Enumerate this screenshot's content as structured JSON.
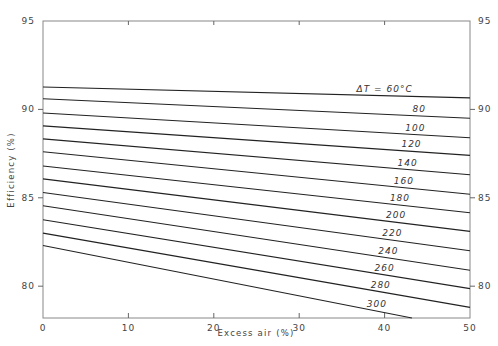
{
  "chart_data": {
    "type": "line",
    "title": "",
    "xlabel": "Excess air (%)",
    "ylabel": "Efficiency (%)",
    "xlim": [
      0,
      50
    ],
    "ylim": [
      78.2,
      95
    ],
    "grid": false,
    "x_ticks": [
      0,
      10,
      20,
      30,
      40,
      50
    ],
    "y_ticks": [
      80,
      85,
      90,
      95
    ],
    "y_ticks_right": [
      80,
      85,
      90,
      95
    ],
    "legend": "inline labels near right end of each line",
    "series": [
      {
        "name": "ΔT = 60°C",
        "label": "ΔT = 60°C",
        "x": [
          0,
          50
        ],
        "values": [
          91.27,
          90.65
        ]
      },
      {
        "name": "80",
        "label": "80",
        "x": [
          0,
          50
        ],
        "values": [
          90.6,
          89.5
        ]
      },
      {
        "name": "100",
        "label": "100",
        "x": [
          0,
          50
        ],
        "values": [
          89.8,
          88.4
        ]
      },
      {
        "name": "120",
        "label": "120",
        "x": [
          0,
          50
        ],
        "values": [
          89.07,
          87.4
        ]
      },
      {
        "name": "140",
        "label": "140",
        "x": [
          0,
          50
        ],
        "values": [
          88.33,
          86.3
        ]
      },
      {
        "name": "160",
        "label": "160",
        "x": [
          0,
          50
        ],
        "values": [
          87.6,
          85.2
        ]
      },
      {
        "name": "180",
        "label": "180",
        "x": [
          0,
          50
        ],
        "values": [
          86.8,
          84.15
        ]
      },
      {
        "name": "200",
        "label": "200",
        "x": [
          0,
          50
        ],
        "values": [
          86.07,
          83.1
        ]
      },
      {
        "name": "220",
        "label": "220",
        "x": [
          0,
          50
        ],
        "values": [
          85.3,
          82.0
        ]
      },
      {
        "name": "240",
        "label": "240",
        "x": [
          0,
          50
        ],
        "values": [
          84.55,
          80.9
        ]
      },
      {
        "name": "260",
        "label": "260",
        "x": [
          0,
          50
        ],
        "values": [
          83.76,
          79.86
        ]
      },
      {
        "name": "280",
        "label": "280",
        "x": [
          0,
          50
        ],
        "values": [
          83.0,
          78.8
        ]
      },
      {
        "name": "300",
        "label": "300",
        "x": [
          0,
          43.2
        ],
        "values": [
          82.3,
          78.2
        ]
      }
    ]
  }
}
